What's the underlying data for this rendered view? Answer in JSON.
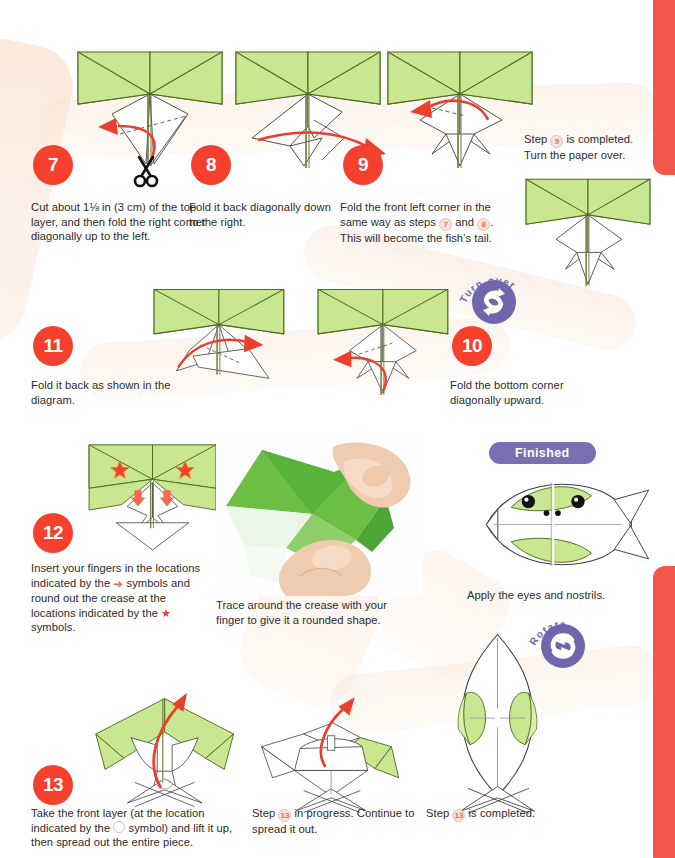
{
  "page": {
    "background": "#ffffff",
    "accent_red": "#F4402D",
    "tab_red": "#F3574B",
    "purple": "#6F66AC",
    "paper_green": "#C4E58A",
    "paper_green_dark": "#7FA93C",
    "band_peach": "#FAE2D0"
  },
  "tabs": [
    {
      "name": "index-tab-top"
    },
    {
      "name": "index-tab-bottom"
    }
  ],
  "steps": [
    {
      "number": "7",
      "caption": "Cut about 1⅛ in (3 cm) of the top layer, and then fold the right corner diagonally up to the left."
    },
    {
      "number": "8",
      "caption": "Fold it back diagonally down to the right."
    },
    {
      "number": "9",
      "caption_parts": [
        "Fold the front left corner in the same way as steps ",
        "7",
        " and ",
        "8",
        ". This will become the fish’s tail."
      ]
    },
    {
      "number": "11",
      "caption": "Fold it back as shown in the diagram."
    },
    {
      "number": "10",
      "caption": "Fold the bottom corner diagonally upward."
    },
    {
      "number": "12",
      "caption_parts": [
        "Insert your fingers in the locations indicated by the ",
        "arrow",
        " symbols and round out the crease at the locations indicated by the ",
        "star",
        " symbols."
      ]
    },
    {
      "number": "13",
      "caption_parts": [
        "Take the front layer (at the location indicated by the ",
        "circle",
        " symbol) and lift it up, then spread out the entire piece."
      ]
    }
  ],
  "notes": {
    "step9_done_line1": "Step",
    "step9_done_num": "9",
    "step9_done_line1b": "is completed.",
    "step9_done_line2": "Turn the paper over.",
    "photo_caption": "Trace around the crease with your finger to give it a rounded shape.",
    "finished_label": "Finished",
    "finished_caption": "Apply the eyes and nostrils.",
    "step13_progress_a": "Step",
    "step13_progress_num": "13",
    "step13_progress_b": "in progress. Continue to spread it out.",
    "step13_done_a": "Step",
    "step13_done_num": "13",
    "step13_done_b": "is completed."
  },
  "markers": {
    "turn_over_label": "Turn over",
    "rotate_label": "Rotate"
  },
  "icons": {
    "scissors": "scissors-icon",
    "turn_over": "turn-over-icon",
    "rotate": "rotate-icon",
    "star": "star-icon",
    "finger_arrow": "finger-arrow-icon"
  }
}
